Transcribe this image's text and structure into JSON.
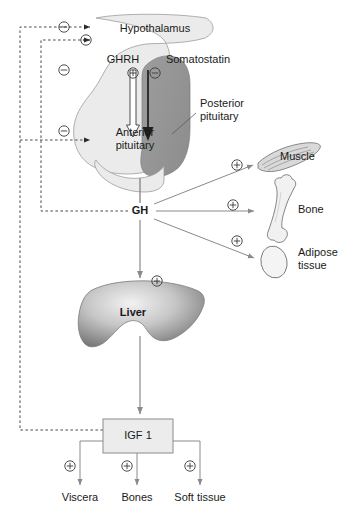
{
  "figure": {
    "type": "physiology-flow-diagram",
    "background": "#ffffff",
    "ink": "#1a1a1a"
  },
  "colors": {
    "outline": "#6f6f6f",
    "arrow": "#8a8a8a",
    "dashed": "#4d4d4d",
    "pituitary_light": "#ebebeb",
    "pituitary_dark": "#9a9a9a",
    "liver_light": "#e2e2e2",
    "liver_dark": "#6e6e6e",
    "box_fill": "#ececec",
    "box_border": "#8c8c8c",
    "organ_fill": "#f1f1f1"
  },
  "nodes": {
    "hypothalamus": {
      "label": "Hypothalamus",
      "x": 155,
      "y": 29
    },
    "ghrh": {
      "label": "GHRH",
      "x": 123,
      "y": 60,
      "sign": "+"
    },
    "somatostatin": {
      "label": "Somatostatin",
      "x": 195,
      "y": 60,
      "sign": "-"
    },
    "anterior_pituitary": {
      "label": "Anterior\npituitary",
      "line1": "Anterior",
      "line2": "pituitary",
      "x": 135,
      "y": 134
    },
    "posterior_pituitary": {
      "label": "Posterior\npituitary",
      "line1": "Posterior",
      "line2": "pituitary",
      "x": 222,
      "y": 105
    },
    "gh": {
      "label": "GH",
      "x": 140,
      "y": 211
    },
    "liver": {
      "label": "Liver",
      "x": 133,
      "y": 313
    },
    "igf1": {
      "label": "IGF 1",
      "x": 137,
      "y": 436
    }
  },
  "targets": {
    "muscle": {
      "label": "Muscle",
      "x": 303,
      "y": 157,
      "sign": "+"
    },
    "bone": {
      "label": "Bone",
      "x": 311,
      "y": 210,
      "sign": "+"
    },
    "adipose": {
      "label": "Adipose\ntissue",
      "line1": "Adipose",
      "line2": "tissue",
      "x": 315,
      "y": 253,
      "sign": "+"
    }
  },
  "igf_targets": [
    {
      "label": "Viscera",
      "x": 80,
      "y": 497,
      "sign": "+"
    },
    {
      "label": "Bones",
      "x": 137,
      "y": 497,
      "sign": "+"
    },
    {
      "label": "Soft tissue",
      "x": 200,
      "y": 497,
      "sign": "+"
    }
  ],
  "signs": {
    "plus": "+",
    "minus": "-",
    "feedback_ghrh_plus": "+",
    "feedback_somatostatin_minus": "-"
  },
  "feedback": {
    "description": "Negative feedback loops from GH and IGF 1 to the hypothalamus and anterior pituitary",
    "loops": [
      {
        "from": "IGF 1",
        "to": "Hypothalamus",
        "sign": "-",
        "sign_x": 64,
        "sign_y": 27
      },
      {
        "from": "GH",
        "to": "Hypothalamus",
        "sign": "-",
        "sign_x": 86,
        "sign_y": 40
      },
      {
        "from": "GH",
        "to": "GHRH neurons",
        "sign": "-",
        "sign_x": 64,
        "sign_y": 70
      },
      {
        "from": "IGF 1",
        "to": "Anterior pituitary",
        "sign": "-",
        "sign_x": 64,
        "sign_y": 130
      }
    ]
  }
}
